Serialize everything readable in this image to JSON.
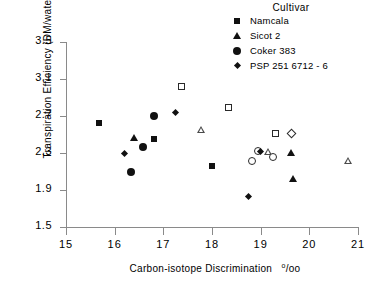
{
  "legend": {
    "title": "Cultivar",
    "entries": [
      {
        "label": "Namcala",
        "marker": "filled-square",
        "key": "namcala"
      },
      {
        "label": "Sicot 2",
        "marker": "filled-triangle",
        "key": "sicot2"
      },
      {
        "label": "Coker 383",
        "marker": "filled-circle",
        "key": "coker383"
      },
      {
        "label": "PSP 251 6712 - 6",
        "marker": "filled-diamond",
        "key": "psp251"
      }
    ]
  },
  "axes": {
    "y_ticks": [
      "3.5",
      "3.1",
      "2.7",
      "2.3",
      "1.9",
      "1.5"
    ],
    "x_ticks": [
      "15",
      "16",
      "17",
      "18",
      "19",
      "20",
      "21"
    ],
    "y_title": "Transpiration Efficiency  (DM/water,  g/kg)",
    "x_title_main": "Carbon-isotope  Discrimination",
    "x_title_units": "o/oo"
  },
  "chart_data": {
    "type": "scatter",
    "title": "",
    "xlabel": "Carbon-isotope Discrimination o/oo",
    "ylabel": "Transpiration Efficiency (DM/water, g/kg)",
    "xlim": [
      15,
      21
    ],
    "ylim": [
      1.5,
      3.5
    ],
    "xtick_step": 1,
    "ytick_step": 0.4,
    "grid": false,
    "legend_position": "top-right",
    "legend_title": "Cultivar",
    "marker_note": "Filled markers shown in legend; open (unfilled) versions of the same shapes also appear in the plot",
    "series": [
      {
        "name": "Namcala",
        "marker": "square",
        "points": [
          {
            "x": 15.68,
            "y": 2.62,
            "fill": "filled"
          },
          {
            "x": 16.8,
            "y": 2.45,
            "fill": "filled"
          },
          {
            "x": 17.38,
            "y": 3.02,
            "fill": "open"
          },
          {
            "x": 18.01,
            "y": 2.16,
            "fill": "filled"
          },
          {
            "x": 18.33,
            "y": 2.79,
            "fill": "open"
          },
          {
            "x": 19.31,
            "y": 2.51,
            "fill": "open"
          }
        ]
      },
      {
        "name": "Sicot 2",
        "marker": "triangle",
        "points": [
          {
            "x": 16.4,
            "y": 2.46,
            "fill": "filled"
          },
          {
            "x": 17.78,
            "y": 2.55,
            "fill": "open"
          },
          {
            "x": 19.16,
            "y": 2.31,
            "fill": "open"
          },
          {
            "x": 19.62,
            "y": 2.3,
            "fill": "filled"
          },
          {
            "x": 19.66,
            "y": 2.02,
            "fill": "filled"
          },
          {
            "x": 20.8,
            "y": 2.21,
            "fill": "open"
          }
        ]
      },
      {
        "name": "Coker 383",
        "marker": "circle",
        "points": [
          {
            "x": 16.34,
            "y": 2.1,
            "fill": "filled"
          },
          {
            "x": 16.58,
            "y": 2.36,
            "fill": "filled"
          },
          {
            "x": 16.8,
            "y": 2.7,
            "fill": "filled"
          },
          {
            "x": 18.82,
            "y": 2.21,
            "fill": "open"
          },
          {
            "x": 18.94,
            "y": 2.32,
            "fill": "open"
          },
          {
            "x": 19.25,
            "y": 2.26,
            "fill": "open"
          }
        ]
      },
      {
        "name": "PSP 251 6712 - 6",
        "marker": "diamond",
        "points": [
          {
            "x": 16.2,
            "y": 2.3,
            "fill": "filled"
          },
          {
            "x": 17.24,
            "y": 2.74,
            "fill": "filled"
          },
          {
            "x": 18.75,
            "y": 1.83,
            "fill": "filled"
          },
          {
            "x": 19.0,
            "y": 2.32,
            "fill": "filled"
          },
          {
            "x": 19.63,
            "y": 2.51,
            "fill": "open"
          }
        ]
      }
    ]
  }
}
